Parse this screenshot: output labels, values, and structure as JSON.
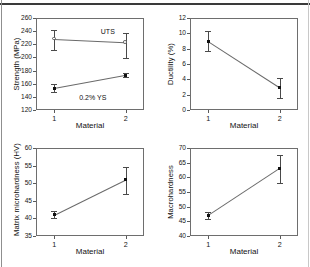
{
  "figure": {
    "layout": "2x2 grid of line plots with error bars",
    "shared_xlabel": "Material",
    "x_categories": [
      "1",
      "2"
    ]
  },
  "chart_data": [
    {
      "id": "strength",
      "type": "line",
      "title": "",
      "xlabel": "Material",
      "ylabel": "Strength (MPa)",
      "categories": [
        "1",
        "2"
      ],
      "ylim": [
        120,
        260
      ],
      "yticks": [
        120,
        140,
        160,
        180,
        200,
        220,
        240,
        260
      ],
      "grid": false,
      "legend": "inline annotations",
      "series": [
        {
          "name": "UTS",
          "marker": "open-circle",
          "values": [
            228,
            223
          ],
          "err_low": [
            17,
            24
          ],
          "err_high": [
            13,
            14
          ],
          "annotation": "UTS"
        },
        {
          "name": "0.2% YS",
          "marker": "filled-square",
          "values": [
            153,
            173
          ],
          "err_low": [
            6,
            3
          ],
          "err_high": [
            7,
            3
          ],
          "annotation": "0.2% YS"
        }
      ]
    },
    {
      "id": "ductility",
      "type": "line",
      "title": "",
      "xlabel": "Material",
      "ylabel": "Ductility (%)",
      "categories": [
        "1",
        "2"
      ],
      "ylim": [
        0,
        12
      ],
      "yticks": [
        0,
        2,
        4,
        6,
        8,
        10,
        12
      ],
      "grid": false,
      "series": [
        {
          "name": "Ductility",
          "marker": "filled-square",
          "values": [
            9.0,
            3.0
          ],
          "err_low": [
            1.3,
            1.4
          ],
          "err_high": [
            1.3,
            1.2
          ]
        }
      ]
    },
    {
      "id": "matrix-microhardness",
      "type": "line",
      "title": "",
      "xlabel": "Material",
      "ylabel": "Matrix microhardness (HV)",
      "categories": [
        "1",
        "2"
      ],
      "ylim": [
        35,
        60
      ],
      "yticks": [
        35,
        40,
        45,
        50,
        55,
        60
      ],
      "grid": false,
      "series": [
        {
          "name": "Matrix microhardness",
          "marker": "filled-square",
          "values": [
            41.0,
            51.0
          ],
          "err_low": [
            1.0,
            4.0
          ],
          "err_high": [
            1.0,
            3.5
          ]
        }
      ]
    },
    {
      "id": "macrohardness",
      "type": "line",
      "title": "",
      "xlabel": "Material",
      "ylabel": "Macrohardness",
      "categories": [
        "1",
        "2"
      ],
      "ylim": [
        40,
        70
      ],
      "yticks": [
        40,
        45,
        50,
        55,
        60,
        65,
        70
      ],
      "grid": false,
      "series": [
        {
          "name": "Macrohardness",
          "marker": "filled-square",
          "values": [
            47.0,
            63.0
          ],
          "err_low": [
            1.2,
            5.0
          ],
          "err_high": [
            1.2,
            4.5
          ]
        }
      ]
    }
  ],
  "colors": {
    "line": "#6a6a6a",
    "marker": "#111111",
    "axis": "#6e6e6e",
    "text": "#121212"
  }
}
